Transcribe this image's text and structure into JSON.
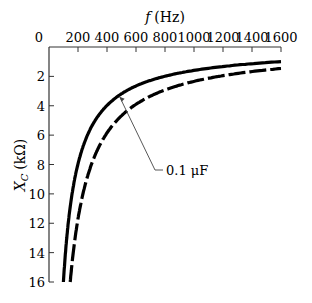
{
  "chart_data": {
    "type": "line",
    "title": "",
    "xlabel": "f (Hz)",
    "ylabel": "X_C (kΩ)",
    "x_axis_position": "top",
    "y_axis_inverted": true,
    "xlim": [
      0,
      1600
    ],
    "ylim": [
      0,
      16
    ],
    "xticks": [
      0,
      200,
      400,
      600,
      800,
      1000,
      1200,
      1400,
      1600
    ],
    "yticks": [
      2,
      4,
      6,
      8,
      10,
      12,
      14,
      16
    ],
    "grid": false,
    "series": [
      {
        "name": "0.1 µF",
        "style": "solid",
        "capacitance_uF": 0.1,
        "x": [
          100,
          125,
          150,
          200,
          300,
          400,
          500,
          600,
          800,
          1000,
          1200,
          1400,
          1600
        ],
        "y": [
          15.9,
          12.7,
          10.6,
          8.0,
          5.3,
          4.0,
          3.2,
          2.65,
          2.0,
          1.6,
          1.3,
          1.1,
          1.0
        ]
      },
      {
        "name": "unlabeled (dashed)",
        "style": "dashed",
        "capacitance_uF": 0.068,
        "x": [
          146,
          175,
          200,
          250,
          300,
          400,
          500,
          600,
          800,
          1000,
          1200,
          1400,
          1600
        ],
        "y": [
          16.0,
          13.4,
          11.7,
          9.4,
          7.8,
          5.9,
          4.7,
          3.9,
          2.9,
          2.3,
          1.95,
          1.7,
          1.45
        ]
      }
    ],
    "annotations": [
      {
        "text": "0.1 µF",
        "points_to": "solid curve"
      }
    ]
  },
  "labels": {
    "xlabel_var": "f",
    "xlabel_unit": "(Hz)",
    "ylabel_var": "X",
    "ylabel_sub": "C",
    "ylabel_unit": "(kΩ)",
    "annotation": "0.1 μF",
    "x_zero": "0"
  }
}
